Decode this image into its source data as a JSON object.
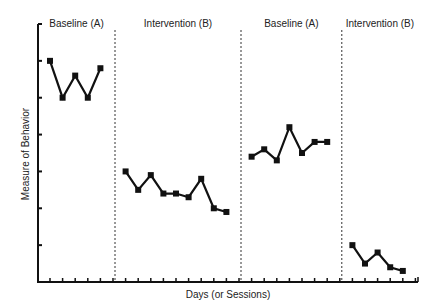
{
  "chart_data": {
    "type": "line",
    "title": "",
    "xlabel": "Days (or Sessions)",
    "ylabel": "Measure of Behavior",
    "ylim": [
      0,
      7
    ],
    "grid": false,
    "legend": "none",
    "phase_labels": [
      "Baseline (A)",
      "Intervention (B)",
      "Baseline (A)",
      "Intervention (B)"
    ],
    "phases": [
      {
        "name": "Baseline (A)",
        "sessions": [
          1,
          2,
          3,
          4,
          5
        ],
        "values": [
          6.0,
          5.0,
          5.6,
          5.0,
          5.8
        ]
      },
      {
        "name": "Intervention (B)",
        "sessions": [
          7,
          8,
          9,
          10,
          11,
          12,
          13,
          14,
          15
        ],
        "values": [
          3.0,
          2.5,
          2.9,
          2.4,
          2.4,
          2.3,
          2.8,
          2.0,
          1.9
        ]
      },
      {
        "name": "Baseline (A)",
        "sessions": [
          17,
          18,
          19,
          20,
          21,
          22,
          23
        ],
        "values": [
          3.4,
          3.6,
          3.3,
          4.2,
          3.5,
          3.8,
          3.8
        ]
      },
      {
        "name": "Intervention (B)",
        "sessions": [
          25,
          26,
          27,
          28,
          29
        ],
        "values": [
          1.0,
          0.5,
          0.8,
          0.4,
          0.3
        ]
      }
    ],
    "phase_change_lines_after_session": [
      6,
      16,
      24
    ],
    "x_ticks": 30
  }
}
